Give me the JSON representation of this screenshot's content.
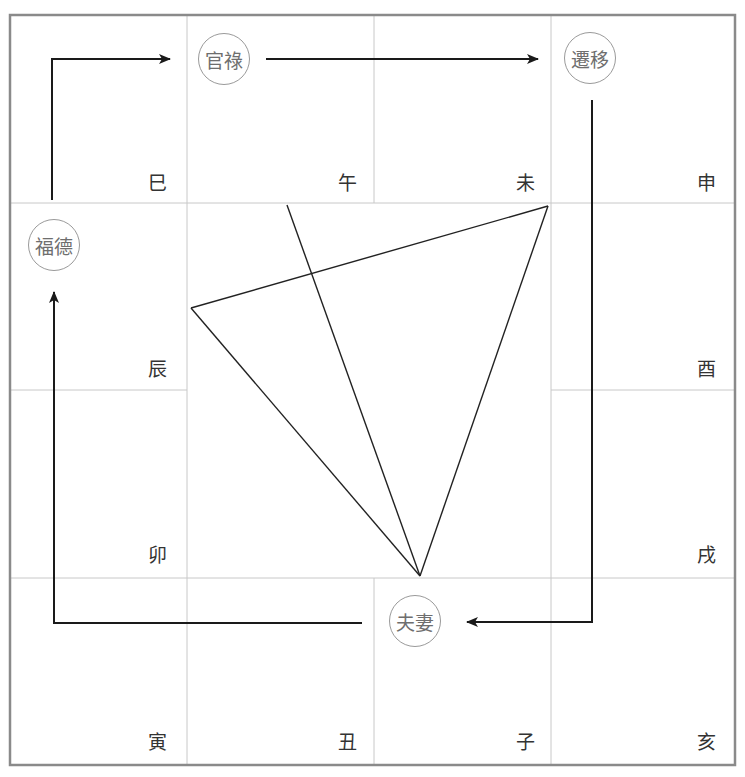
{
  "diagram": {
    "type": "twelve-palace-chart",
    "grid": {
      "border_color": "#8a8a8a",
      "line_color": "#c8c8c8",
      "columns_x": [
        10,
        187,
        374,
        551,
        735
      ],
      "rows_y": [
        15,
        203,
        390,
        578,
        765
      ]
    },
    "branches": [
      {
        "id": "si",
        "label": "巳",
        "x": 148,
        "y": 174
      },
      {
        "id": "wu",
        "label": "午",
        "x": 338,
        "y": 174
      },
      {
        "id": "wei",
        "label": "未",
        "x": 516,
        "y": 174
      },
      {
        "id": "shen",
        "label": "申",
        "x": 697,
        "y": 174
      },
      {
        "id": "chen",
        "label": "辰",
        "x": 148,
        "y": 360
      },
      {
        "id": "you",
        "label": "酉",
        "x": 697,
        "y": 360
      },
      {
        "id": "mao",
        "label": "卯",
        "x": 148,
        "y": 546
      },
      {
        "id": "xu",
        "label": "戌",
        "x": 697,
        "y": 546
      },
      {
        "id": "yin",
        "label": "寅",
        "x": 148,
        "y": 733
      },
      {
        "id": "chou",
        "label": "丑",
        "x": 338,
        "y": 733
      },
      {
        "id": "zi",
        "label": "子",
        "x": 516,
        "y": 733
      },
      {
        "id": "hai",
        "label": "亥",
        "x": 697,
        "y": 733
      }
    ],
    "palaces": [
      {
        "id": "guanlu",
        "label": "官祿",
        "cx": 224,
        "cy": 59
      },
      {
        "id": "qianyi",
        "label": "遷移",
        "cx": 590,
        "cy": 58
      },
      {
        "id": "fude",
        "label": "福德",
        "cx": 54,
        "cy": 245
      },
      {
        "id": "fuqi",
        "label": "夫妻",
        "cx": 415,
        "cy": 621
      }
    ],
    "arrows": [
      {
        "from": "fude",
        "to": "guanlu",
        "points": [
          [
            52,
            200
          ],
          [
            52,
            59
          ],
          [
            170,
            59
          ]
        ]
      },
      {
        "from": "guanlu",
        "to": "qianyi",
        "points": [
          [
            266,
            59
          ],
          [
            538,
            59
          ]
        ]
      },
      {
        "from": "qianyi",
        "to": "fuqi",
        "points": [
          [
            592,
            100
          ],
          [
            592,
            622
          ],
          [
            467,
            622
          ]
        ]
      },
      {
        "from": "fuqi",
        "to": "fude",
        "points": [
          [
            362,
            623
          ],
          [
            54,
            623
          ],
          [
            54,
            292
          ]
        ]
      }
    ],
    "lines": [
      {
        "name": "triangle-edge-top",
        "x1": 191,
        "y1": 308,
        "x2": 548,
        "y2": 206
      },
      {
        "name": "triangle-edge-left",
        "x1": 191,
        "y1": 308,
        "x2": 420,
        "y2": 576
      },
      {
        "name": "triangle-edge-right",
        "x1": 548,
        "y1": 206,
        "x2": 420,
        "y2": 576
      },
      {
        "name": "center-line",
        "x1": 287,
        "y1": 205,
        "x2": 420,
        "y2": 576
      }
    ],
    "line_color": "#222222"
  }
}
